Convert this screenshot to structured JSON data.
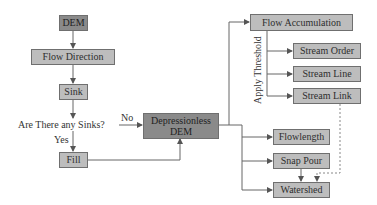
{
  "diagram": {
    "type": "flowchart",
    "nodes": {
      "dem": "DEM",
      "flow_direction": "Flow Direction",
      "sink": "Sink",
      "depressionless_line1": "Depressionless",
      "depressionless_line2": "DEM",
      "fill": "Fill",
      "flow_accumulation": "Flow Accumulation",
      "stream_order": "Stream Order",
      "stream_line": "Stream Line",
      "stream_link": "Stream Link",
      "flowlength": "Flowlength",
      "snap_pour": "Snap Pour",
      "watershed": "Watershed"
    },
    "labels": {
      "decision": "Are There any Sinks?",
      "yes": "Yes",
      "no": "No",
      "apply_threshold": "Apply Threshold"
    },
    "colors": {
      "box_fill": "#bdbdbd",
      "box_dark_fill": "#8a8a8a",
      "line": "#555555",
      "border": "#6f6f6f"
    },
    "edges": [
      {
        "from": "DEM",
        "to": "Flow Direction"
      },
      {
        "from": "Flow Direction",
        "to": "Sink"
      },
      {
        "from": "Sink",
        "to": "Are There any Sinks?"
      },
      {
        "from": "Are There any Sinks?",
        "to": "Depressionless DEM",
        "label": "No"
      },
      {
        "from": "Are There any Sinks?",
        "to": "Fill",
        "label": "Yes"
      },
      {
        "from": "Fill",
        "to": "Depressionless DEM"
      },
      {
        "from": "Depressionless DEM",
        "to": "Flow Accumulation"
      },
      {
        "from": "Flow Accumulation",
        "to": "Stream Order",
        "label": "Apply Threshold"
      },
      {
        "from": "Flow Accumulation",
        "to": "Stream Line",
        "label": "Apply Threshold"
      },
      {
        "from": "Flow Accumulation",
        "to": "Stream Link",
        "label": "Apply Threshold"
      },
      {
        "from": "Depressionless DEM",
        "to": "Flowlength"
      },
      {
        "from": "Depressionless DEM",
        "to": "Snap Pour"
      },
      {
        "from": "Depressionless DEM",
        "to": "Watershed"
      },
      {
        "from": "Snap Pour",
        "to": "Watershed"
      },
      {
        "from": "Stream Link",
        "to": "Watershed",
        "style": "dashed"
      }
    ]
  }
}
